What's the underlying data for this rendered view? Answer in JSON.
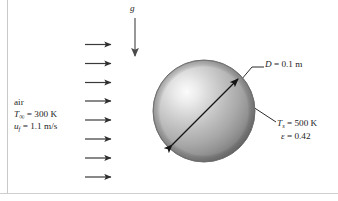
{
  "figure": {
    "name": "sphere-in-air-crossflow-heat-transfer-diagram",
    "background_color": "#ffffff",
    "width": 338,
    "height": 201
  },
  "frame": {
    "left_border_color": "#c8c8c8",
    "bottom_border_color": "#c8c8c8"
  },
  "gravity": {
    "symbol": "g",
    "arrow_direction": "down",
    "arrow_color": "#6e6e6e"
  },
  "flow": {
    "arrow_count": 8,
    "arrow_direction": "right",
    "arrow_color": "#3a3a3a",
    "fluid_label": "air",
    "freestream_temperature": {
      "symbol": "T",
      "subscript": "∞",
      "equals": "=",
      "value": "300 K",
      "full_text": "T∞ = 300 K"
    },
    "fluid_velocity": {
      "symbol": "u",
      "subscript": "f",
      "equals": "=",
      "value": "1.1 m/s",
      "full_text": "uf = 1.1 m/s"
    }
  },
  "sphere": {
    "center_x": 204,
    "center_y": 111,
    "radius": 51,
    "outline_color": "#6b6b6b",
    "highlight_color": "#f2f2f2",
    "midtone_color": "#b6b6b6",
    "shadow_color": "#6a6a6a",
    "diameter_arrow": {
      "style": "double-headed",
      "color": "#1a1a1a"
    },
    "diameter": {
      "symbol": "D",
      "equals": "=",
      "value": "0.1 m",
      "full_text": "D = 0.1 m"
    },
    "surface_temperature": {
      "symbol": "T",
      "subscript": "s",
      "equals": "=",
      "value": "500 K",
      "full_text": "Ts = 500 K"
    },
    "emissivity": {
      "symbol": "ε",
      "equals": "=",
      "value": "0.42",
      "full_text": "ε = 0.42"
    },
    "leader_line_color": "#2b2b2b"
  }
}
